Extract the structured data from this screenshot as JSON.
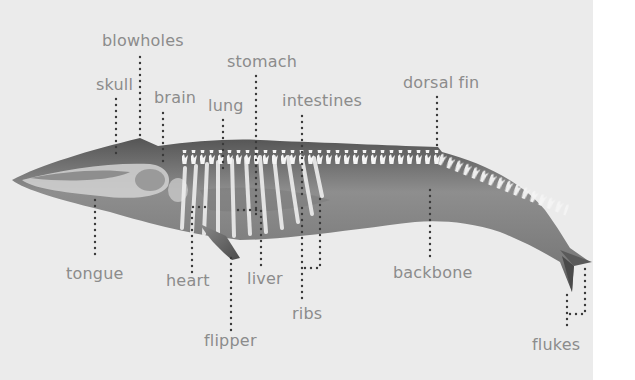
{
  "diagram": {
    "colors": {
      "background": "#ebebeb",
      "label_text": "#8c8c8c",
      "leader_dots": "#3a3a3a",
      "body_dark": "#5c5c5c",
      "body_mid": "#8a8a8a",
      "bone": "#f2f2f2"
    },
    "labels": [
      {
        "id": "blowholes",
        "text": "blowholes"
      },
      {
        "id": "skull",
        "text": "skull"
      },
      {
        "id": "brain",
        "text": "brain"
      },
      {
        "id": "lung",
        "text": "lung"
      },
      {
        "id": "stomach",
        "text": "stomach"
      },
      {
        "id": "intestines",
        "text": "intestines"
      },
      {
        "id": "dorsal_fin",
        "text": "dorsal fin"
      },
      {
        "id": "tongue",
        "text": "tongue"
      },
      {
        "id": "heart",
        "text": "heart"
      },
      {
        "id": "liver",
        "text": "liver"
      },
      {
        "id": "flipper",
        "text": "flipper"
      },
      {
        "id": "ribs",
        "text": "ribs"
      },
      {
        "id": "backbone",
        "text": "backbone"
      },
      {
        "id": "flukes",
        "text": "flukes"
      }
    ]
  }
}
